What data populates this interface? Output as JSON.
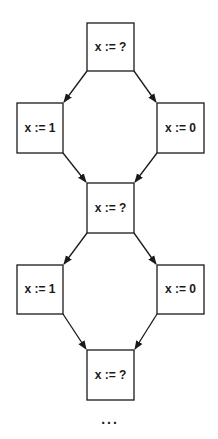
{
  "diagram": {
    "type": "control-flow-graph",
    "nodes": [
      {
        "id": "n1",
        "label": "x := ?",
        "x": 87,
        "y": 23,
        "w": 47,
        "h": 48
      },
      {
        "id": "n2",
        "label": "x := 1",
        "x": 17,
        "y": 103,
        "w": 46,
        "h": 50
      },
      {
        "id": "n3",
        "label": "x := 0",
        "x": 157,
        "y": 103,
        "w": 47,
        "h": 50
      },
      {
        "id": "n4",
        "label": "x := ?",
        "x": 87,
        "y": 183,
        "w": 47,
        "h": 50
      },
      {
        "id": "n5",
        "label": "x := 1",
        "x": 17,
        "y": 265,
        "w": 46,
        "h": 49
      },
      {
        "id": "n6",
        "label": "x := 0",
        "x": 157,
        "y": 265,
        "w": 47,
        "h": 49
      },
      {
        "id": "n7",
        "label": "x := ?",
        "x": 87,
        "y": 350,
        "w": 47,
        "h": 50
      }
    ],
    "edges": [
      {
        "from": "n1",
        "to": "n2"
      },
      {
        "from": "n1",
        "to": "n3"
      },
      {
        "from": "n2",
        "to": "n4"
      },
      {
        "from": "n3",
        "to": "n4"
      },
      {
        "from": "n4",
        "to": "n5"
      },
      {
        "from": "n4",
        "to": "n6"
      },
      {
        "from": "n5",
        "to": "n7"
      },
      {
        "from": "n6",
        "to": "n7"
      }
    ],
    "continuation": "..."
  },
  "labels": {
    "n1": "x := ?",
    "n2": "x := 1",
    "n3": "x := 0",
    "n4": "x := ?",
    "n5": "x := 1",
    "n6": "x := 0",
    "n7": "x := ?",
    "ellipsis": "..."
  }
}
